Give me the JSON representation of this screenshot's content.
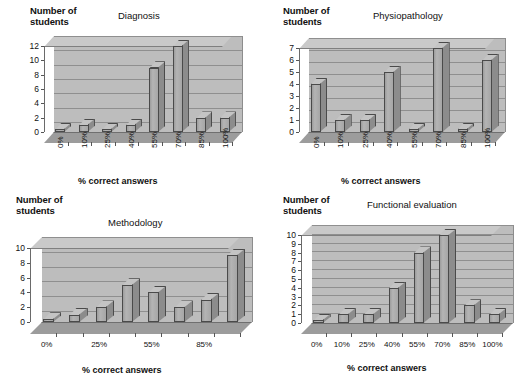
{
  "figure": {
    "panel_count": 4,
    "shared_y_axis_title": "Number of\nstudents",
    "shared_x_axis_title": "%  correct answers"
  },
  "chart_data": [
    {
      "type": "bar",
      "title": "Diagnosis",
      "xlabel": "%  correct answers",
      "ylabel": "Number of students",
      "categories": [
        "0%",
        "10%",
        "25%",
        "40%",
        "55%",
        "70%",
        "85%",
        "100%"
      ],
      "values": [
        0,
        1,
        0,
        1,
        9,
        12,
        2,
        2
      ],
      "ylim": [
        0,
        12
      ],
      "ytick_labels": [
        "0",
        "2",
        "4",
        "6",
        "8",
        "10",
        "12"
      ],
      "ytick_values": [
        0,
        2,
        4,
        6,
        8,
        10,
        12
      ],
      "xtick_labels": [
        "0%",
        "10%",
        "25%",
        "40%",
        "55%",
        "70%",
        "85%",
        "100%"
      ],
      "xtick_rotation": 90,
      "grid": true,
      "legend": false,
      "style": "3d-column"
    },
    {
      "type": "bar",
      "title": "Physiopathology",
      "xlabel": "%  correct answers",
      "ylabel": "Number of students",
      "categories": [
        "0%",
        "10%",
        "25%",
        "40%",
        "55%",
        "70%",
        "85%",
        "100%"
      ],
      "values": [
        4,
        1,
        1,
        5,
        0,
        7,
        0,
        6
      ],
      "ylim": [
        0,
        7
      ],
      "ytick_labels": [
        "0",
        "1",
        "2",
        "3",
        "4",
        "5",
        "6",
        "7"
      ],
      "ytick_values": [
        0,
        1,
        2,
        3,
        4,
        5,
        6,
        7
      ],
      "xtick_labels": [
        "0%",
        "10%",
        "25%",
        "40%",
        "55%",
        "70%",
        "85%",
        "100%"
      ],
      "xtick_rotation": 90,
      "grid": true,
      "legend": false,
      "style": "3d-column"
    },
    {
      "type": "bar",
      "title": "Methodology",
      "xlabel": "%  correct answers",
      "ylabel": "Number of students",
      "categories": [
        "0%",
        "10%",
        "25%",
        "40%",
        "55%",
        "70%",
        "85%",
        "100%"
      ],
      "values": [
        0,
        1,
        2,
        5,
        4,
        2,
        3,
        9
      ],
      "ylim": [
        0,
        10
      ],
      "ytick_labels": [
        "0",
        "2",
        "4",
        "6",
        "8",
        "10"
      ],
      "ytick_values": [
        0,
        2,
        4,
        6,
        8,
        10
      ],
      "xtick_labels": [
        "0%",
        "",
        "25%",
        "",
        "55%",
        "",
        "85%",
        ""
      ],
      "xtick_rotation": 0,
      "grid": true,
      "legend": false,
      "style": "3d-column"
    },
    {
      "type": "bar",
      "title": "Functional evaluation",
      "xlabel": "%  correct answers",
      "ylabel": "Number of students",
      "categories": [
        "0%",
        "10%",
        "25%",
        "40%",
        "55%",
        "70%",
        "85%",
        "100%"
      ],
      "values": [
        0,
        1,
        1,
        4,
        8,
        10,
        2,
        1
      ],
      "ylim": [
        0,
        10
      ],
      "ytick_labels": [
        "0",
        "1",
        "2",
        "3",
        "4",
        "5",
        "6",
        "7",
        "8",
        "9",
        "10"
      ],
      "ytick_values": [
        0,
        1,
        2,
        3,
        4,
        5,
        6,
        7,
        8,
        9,
        10
      ],
      "xtick_labels": [
        "0%",
        "10%",
        "25%",
        "40%",
        "55%",
        "70%",
        "85%",
        "100%"
      ],
      "xtick_rotation": 0,
      "grid": true,
      "legend": false,
      "style": "3d-column"
    }
  ],
  "colors": {
    "bar_fill": "#a8a8a8",
    "bar_top": "#c4c4c4",
    "bar_side": "#8c8c8c",
    "bar_outline": "#4a4a4a",
    "plot_wall": "#bdbdbd",
    "plot_wall_top": "#c9c9c9",
    "plot_floor": "#9c9c9c",
    "gridline": "#8f8f8f",
    "text": "#111111",
    "background": "#ffffff"
  }
}
